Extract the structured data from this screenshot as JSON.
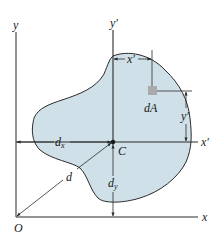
{
  "figure": {
    "type": "parallel-axis theorem diagram for an area",
    "colors": {
      "region_fill": "#cfe0e8",
      "region_stroke": "#2b2b2b",
      "element_fill": "#a9aaab",
      "axis": "#2b2b2b"
    },
    "labels": {
      "y_axis": "y",
      "x_axis": "x",
      "origin": "O",
      "y_prime_axis": "y′",
      "x_prime_axis": "x′",
      "centroid": "C",
      "element": "dA",
      "dim_x_prime": "x′",
      "dim_y_prime": "y′",
      "dx": "d",
      "dx_sub": "x",
      "dy": "d",
      "dy_sub": "y",
      "d": "d"
    }
  }
}
